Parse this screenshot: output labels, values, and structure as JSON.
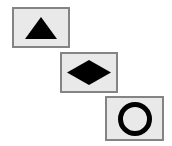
{
  "canvas": {
    "width": 172,
    "height": 146,
    "background_color": "#ffffff",
    "description": "Three bordered cards arranged in a descending diagonal cascade, each containing one solid black geometric shape."
  },
  "style": {
    "card_fill_color": "#e9e9e9",
    "card_border_color": "#848484",
    "card_border_width": 2,
    "shape_color": "#000000"
  },
  "cards": [
    {
      "id": "card-triangle",
      "shape_name": "triangle",
      "shape_label": "Triangle",
      "fill": "solid",
      "x": 12,
      "y": 7,
      "width": 58,
      "height": 41,
      "shape_width": 32,
      "shape_height": 22
    },
    {
      "id": "card-diamond",
      "shape_name": "diamond",
      "shape_label": "Diamond",
      "fill": "solid",
      "x": 60,
      "y": 52,
      "width": 58,
      "height": 41,
      "shape_width": 44,
      "shape_height": 25
    },
    {
      "id": "card-circle",
      "shape_name": "circle",
      "shape_label": "Circle",
      "fill": "outline",
      "x": 105,
      "y": 96,
      "width": 59,
      "height": 45,
      "shape_width": 34,
      "shape_height": 34,
      "stroke_width": 5
    }
  ]
}
